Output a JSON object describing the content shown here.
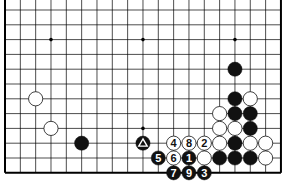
{
  "diagram": {
    "type": "go-board-partial",
    "columns": 19,
    "visible_rows": 12,
    "edges": {
      "left": true,
      "right": true,
      "bottom": true,
      "top": false
    },
    "colors": {
      "background": "#ffffff",
      "line": "#000000",
      "black_stone": "#111111",
      "white_stone": "#ffffff"
    },
    "star_points": [
      {
        "col": 3,
        "row": 2
      },
      {
        "col": 9,
        "row": 2
      },
      {
        "col": 15,
        "row": 2
      },
      {
        "col": 9,
        "row": 8
      }
    ],
    "stones": [
      {
        "col": 15,
        "row": 4,
        "color": "black",
        "label": ""
      },
      {
        "col": 15,
        "row": 6,
        "color": "black",
        "label": ""
      },
      {
        "col": 16,
        "row": 6,
        "color": "white",
        "label": ""
      },
      {
        "col": 2,
        "row": 6,
        "color": "white",
        "label": ""
      },
      {
        "col": 14,
        "row": 7,
        "color": "white",
        "label": ""
      },
      {
        "col": 15,
        "row": 7,
        "color": "black",
        "label": ""
      },
      {
        "col": 16,
        "row": 7,
        "color": "black",
        "label": ""
      },
      {
        "col": 3,
        "row": 8,
        "color": "white",
        "label": ""
      },
      {
        "col": 14,
        "row": 8,
        "color": "white",
        "label": ""
      },
      {
        "col": 15,
        "row": 8,
        "color": "white",
        "label": ""
      },
      {
        "col": 16,
        "row": 8,
        "color": "black",
        "label": ""
      },
      {
        "col": 5,
        "row": 9,
        "color": "black",
        "label": ""
      },
      {
        "col": 9,
        "row": 9,
        "color": "black",
        "label": "",
        "mark": "triangle"
      },
      {
        "col": 11,
        "row": 9,
        "color": "white",
        "label": "4"
      },
      {
        "col": 12,
        "row": 9,
        "color": "white",
        "label": "8"
      },
      {
        "col": 13,
        "row": 9,
        "color": "white",
        "label": "2"
      },
      {
        "col": 14,
        "row": 9,
        "color": "white",
        "label": ""
      },
      {
        "col": 15,
        "row": 9,
        "color": "black",
        "label": ""
      },
      {
        "col": 16,
        "row": 9,
        "color": "white",
        "label": ""
      },
      {
        "col": 17,
        "row": 9,
        "color": "white",
        "label": ""
      },
      {
        "col": 10,
        "row": 10,
        "color": "black",
        "label": "5"
      },
      {
        "col": 11,
        "row": 10,
        "color": "white",
        "label": "6"
      },
      {
        "col": 12,
        "row": 10,
        "color": "black",
        "label": "1"
      },
      {
        "col": 13,
        "row": 10,
        "color": "white",
        "label": ""
      },
      {
        "col": 14,
        "row": 10,
        "color": "black",
        "label": ""
      },
      {
        "col": 15,
        "row": 10,
        "color": "black",
        "label": ""
      },
      {
        "col": 16,
        "row": 10,
        "color": "black",
        "label": ""
      },
      {
        "col": 17,
        "row": 10,
        "color": "white",
        "label": ""
      },
      {
        "col": 11,
        "row": 11,
        "color": "black",
        "label": "7"
      },
      {
        "col": 12,
        "row": 11,
        "color": "black",
        "label": "9"
      },
      {
        "col": 13,
        "row": 11,
        "color": "black",
        "label": "3"
      }
    ]
  }
}
